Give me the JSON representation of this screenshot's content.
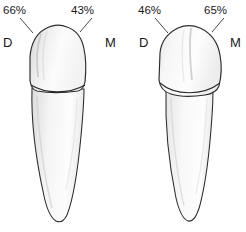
{
  "figure": {
    "background_color": "#ffffff",
    "ink_color": "#222222",
    "enamel_fill": "#fbfbfb",
    "root_fill": "#fcfcfc",
    "shading_color": "#d8d8d8"
  },
  "teeth": [
    {
      "id": "left-tooth",
      "name": "mandibular-tooth-left",
      "distal": {
        "side_label": "D",
        "percent_label": "66%"
      },
      "mesial": {
        "side_label": "M",
        "percent_label": "43%"
      }
    },
    {
      "id": "right-tooth",
      "name": "mandibular-tooth-right",
      "distal": {
        "side_label": "D",
        "percent_label": "46%"
      },
      "mesial": {
        "side_label": "M",
        "percent_label": "65%"
      }
    }
  ]
}
